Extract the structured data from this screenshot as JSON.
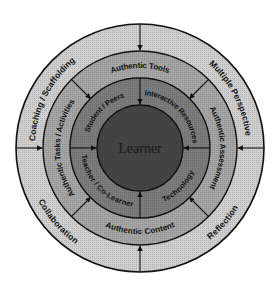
{
  "diagram": {
    "center": {
      "label": "Learner",
      "color": "#3a3a3a"
    },
    "rings": [
      {
        "name": "inner-ring",
        "color": "#6e6e6e",
        "labels": [
          "Student / Peers",
          "Interactive Resources",
          "Technology",
          "Teacher / Co-Learner"
        ]
      },
      {
        "name": "middle-ring",
        "color": "#9a9a9a",
        "labels": [
          "Authentic Tools",
          "Authentic Assessment",
          "Authentic Content",
          "Authentic Tasks / Activities"
        ]
      },
      {
        "name": "outer-ring",
        "color": "#c9c9c9",
        "labels": [
          "Coaching / Scaffolding",
          "Multiple Perspective",
          "Reflection",
          "Collaboration"
        ]
      }
    ],
    "arrows": {
      "outer": [
        "north",
        "east",
        "south",
        "west"
      ],
      "middle": [
        "north-east",
        "south-east",
        "south-west",
        "north-west"
      ],
      "inner": [
        "north",
        "east",
        "south",
        "west"
      ]
    }
  }
}
